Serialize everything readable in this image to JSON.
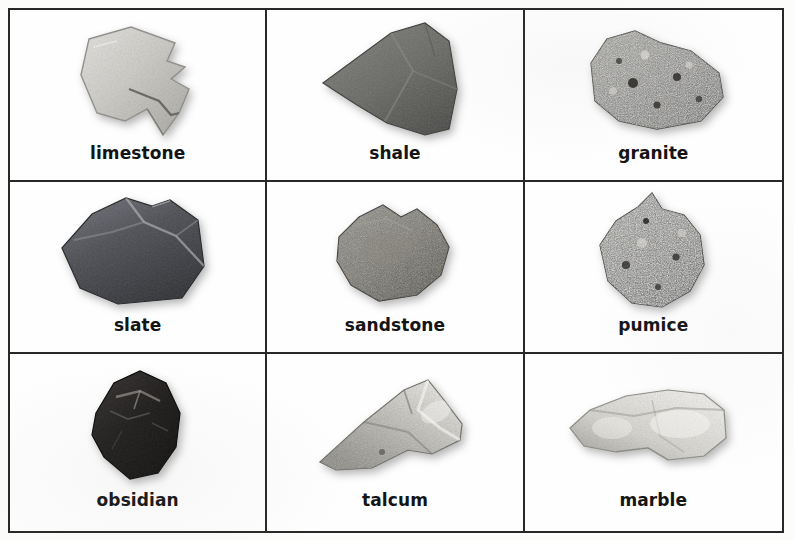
{
  "page": {
    "background_color": "#fcfcfa",
    "border_color": "#272727",
    "label_color": "#141414",
    "columns": 3,
    "rows": 3
  },
  "cells": [
    {
      "label": "limestone",
      "icon": "limestone-rock-icon",
      "rock_type": "sedimentary",
      "base_color": "#c9c7c2",
      "shade_color": "#9c9a94",
      "highlight_color": "#e2e0dc",
      "texture": "grainy-light"
    },
    {
      "label": "shale",
      "icon": "shale-rock-icon",
      "rock_type": "sedimentary",
      "base_color": "#6e6f6b",
      "shade_color": "#4a4b48",
      "highlight_color": "#8c8d88",
      "texture": "flat-dark"
    },
    {
      "label": "granite",
      "icon": "granite-rock-icon",
      "rock_type": "igneous",
      "base_color": "#8d8c86",
      "shade_color": "#3b3a37",
      "highlight_color": "#d6d4ce",
      "texture": "speckled"
    },
    {
      "label": "slate",
      "icon": "slate-rock-icon",
      "rock_type": "metamorphic",
      "base_color": "#55565a",
      "shade_color": "#2e2f33",
      "highlight_color": "#8f9094",
      "texture": "smooth-dark"
    },
    {
      "label": "sandstone",
      "icon": "sandstone-rock-icon",
      "rock_type": "sedimentary",
      "base_color": "#76746d",
      "shade_color": "#4d4b46",
      "highlight_color": "#9e9c94",
      "texture": "granular"
    },
    {
      "label": "pumice",
      "icon": "pumice-rock-icon",
      "rock_type": "igneous",
      "base_color": "#807f78",
      "shade_color": "#2c2b28",
      "highlight_color": "#ddddd6",
      "texture": "vesicular-mottled"
    },
    {
      "label": "obsidian",
      "icon": "obsidian-rock-icon",
      "rock_type": "igneous",
      "base_color": "#211f1e",
      "shade_color": "#0a0909",
      "highlight_color": "#6e6a66",
      "texture": "glassy-black"
    },
    {
      "label": "talcum",
      "icon": "talcum-rock-icon",
      "rock_type": "metamorphic",
      "base_color": "#a9a7a0",
      "shade_color": "#6f6d67",
      "highlight_color": "#e6e4df",
      "texture": "pearly-streaked"
    },
    {
      "label": "marble",
      "icon": "marble-rock-icon",
      "rock_type": "metamorphic",
      "base_color": "#cfcdc7",
      "shade_color": "#8e8c86",
      "highlight_color": "#f4f3f0",
      "texture": "crystalline-light"
    }
  ]
}
